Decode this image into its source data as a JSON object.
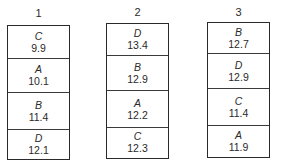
{
  "columns": [
    {
      "label": "1",
      "cells": [
        {
          "letter": "C",
          "value": "9.9"
        },
        {
          "letter": "A",
          "value": "10.1"
        },
        {
          "letter": "B",
          "value": "11.4"
        },
        {
          "letter": "D",
          "value": "12.1"
        }
      ]
    },
    {
      "label": "2",
      "cells": [
        {
          "letter": "D",
          "value": "13.4"
        },
        {
          "letter": "B",
          "value": "12.9"
        },
        {
          "letter": "A",
          "value": "12.2"
        },
        {
          "letter": "C",
          "value": "12.3"
        }
      ]
    },
    {
      "label": "3",
      "cells": [
        {
          "letter": "B",
          "value": "12.7"
        },
        {
          "letter": "D",
          "value": "12.9"
        },
        {
          "letter": "C",
          "value": "11.4"
        },
        {
          "letter": "A",
          "value": "11.9"
        }
      ]
    }
  ]
}
